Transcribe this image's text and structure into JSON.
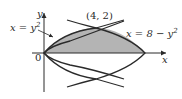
{
  "figure": {
    "type": "region between parabolas",
    "colors": {
      "shade": "#b4b4b4",
      "stroke": "#2a2a2a",
      "background": "#ffffff"
    },
    "axes": {
      "x_label": "x",
      "y_label": "y",
      "origin_label": "0"
    },
    "curves": [
      {
        "id": "left",
        "label": "x = y²",
        "equation": "x = y^2"
      },
      {
        "id": "right",
        "label": "x = 8 − y²",
        "equation": "x = 8 - y^2"
      }
    ],
    "points": [
      {
        "label": "(4, 2)",
        "x": 4,
        "y": 2
      }
    ],
    "shaded_region": "between x = y^2 and x = 8 - y^2 for 0 <= y <= 2"
  },
  "text": {
    "y_axis": "y",
    "x_axis": "x",
    "origin": "0",
    "point_label": "(4, 2)",
    "left_curve_x": "x = y",
    "left_curve_exp": "2",
    "right_curve": "x = 8 − y",
    "right_curve_exp": "2"
  }
}
